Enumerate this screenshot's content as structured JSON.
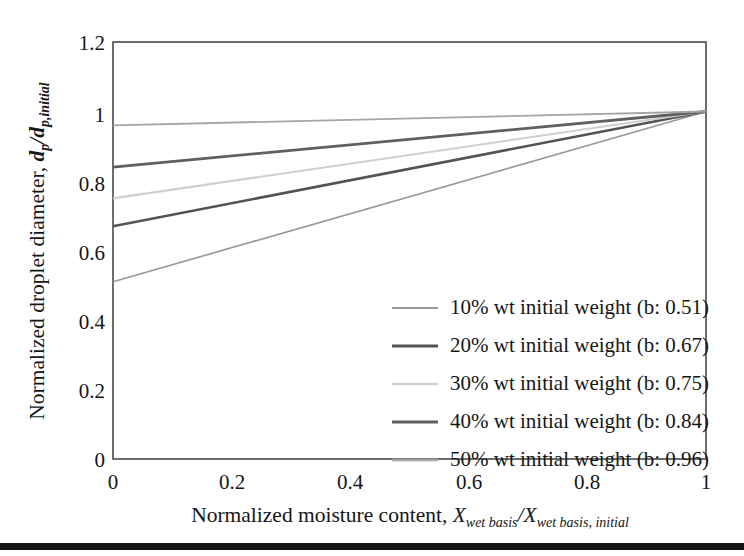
{
  "chart_data": {
    "type": "line",
    "title": "",
    "xlabel": "Normalized moisture content, X_wet basis / X_wet basis, initial",
    "ylabel": "Normalized droplet diameter, d_p / d_p,initial",
    "xlim": [
      0,
      1
    ],
    "ylim": [
      0,
      1.2
    ],
    "xticks": [
      "0",
      "0.2",
      "0.4",
      "0.6",
      "0.8",
      "1"
    ],
    "xtick_values": [
      0,
      0.2,
      0.4,
      0.6,
      0.8,
      1
    ],
    "yticks": [
      "0",
      "0.2",
      "0.4",
      "0.6",
      "0.8",
      "1",
      "1.2"
    ],
    "ytick_values": [
      0,
      0.2,
      0.4,
      0.6,
      0.8,
      1,
      1.2
    ],
    "grid": false,
    "legend_position": "lower right",
    "convergence_point": [
      1,
      1
    ],
    "series": [
      {
        "name": "10% wt initial weight (b: 0.51)",
        "b": 0.51,
        "color": "#9a9a9a",
        "width": 1.7,
        "x": [
          0,
          1
        ],
        "values": [
          0.51,
          1.0
        ]
      },
      {
        "name": "20% wt initial weight (b: 0.67)",
        "b": 0.67,
        "color": "#535353",
        "width": 2.6,
        "x": [
          0,
          1
        ],
        "values": [
          0.67,
          1.0
        ]
      },
      {
        "name": "30% wt initial weight (b: 0.75)",
        "b": 0.75,
        "color": "#cfcfcf",
        "width": 2.1,
        "x": [
          0,
          1
        ],
        "values": [
          0.75,
          1.0
        ]
      },
      {
        "name": "40% wt initial weight (b: 0.84)",
        "b": 0.84,
        "color": "#606060",
        "width": 2.8,
        "x": [
          0,
          1
        ],
        "values": [
          0.84,
          1.0
        ]
      },
      {
        "name": "50% wt initial weight (b: 0.96)",
        "b": 0.96,
        "color": "#a5a5a5",
        "width": 1.9,
        "x": [
          0,
          1
        ],
        "values": [
          0.96,
          1.0
        ]
      }
    ]
  },
  "axes": {
    "y_title_parts": {
      "lead": "Normalized droplet diameter, ",
      "num": "d",
      "num_sub": "p",
      "slash": "/",
      "den": "d",
      "den_sub": "p,initial"
    },
    "x_title_parts": {
      "lead": "Normalized moisture content, ",
      "num": "X",
      "num_sub": "wet basis",
      "slash": "/",
      "den": "X",
      "den_sub": "wet basis, initial"
    }
  },
  "legend": {
    "entries": [
      {
        "label": "10% wt initial weight (b: 0.51)"
      },
      {
        "label": "20% wt initial weight (b: 0.67)"
      },
      {
        "label": "30% wt initial weight (b: 0.75)"
      },
      {
        "label": "40% wt initial weight (b: 0.84)"
      },
      {
        "label": "50% wt initial weight (b: 0.96)"
      }
    ]
  },
  "decorations": {
    "bottom_rule_color": "#141414"
  }
}
